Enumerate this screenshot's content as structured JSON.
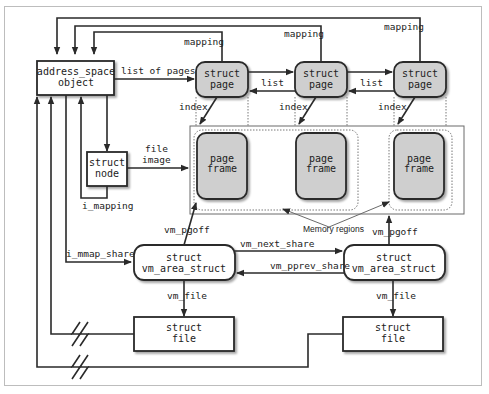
{
  "diagram": {
    "nodes": {
      "address_space": {
        "line1": "address_space",
        "line2": "object"
      },
      "page1": {
        "line1": "struct",
        "line2": "page"
      },
      "page2": {
        "line1": "struct",
        "line2": "page"
      },
      "page3": {
        "line1": "struct",
        "line2": "page"
      },
      "node": {
        "line1": "struct",
        "line2": "node"
      },
      "frame1": {
        "line1": "page",
        "line2": "frame"
      },
      "frame2": {
        "line1": "page",
        "line2": "frame"
      },
      "frame3": {
        "line1": "page",
        "line2": "frame"
      },
      "vma1": {
        "line1": "struct",
        "line2": "vm_area_struct"
      },
      "vma2": {
        "line1": "struct",
        "line2": "vm_area_struct"
      },
      "file1": {
        "line1": "struct",
        "line2": "file"
      },
      "file2": {
        "line1": "struct",
        "line2": "file"
      }
    },
    "labels": {
      "mapping1": "mapping",
      "mapping2": "mapping",
      "mapping3": "mapping",
      "list_of_pages": "list of pages",
      "list1": "list",
      "list2": "list",
      "index1": "index",
      "index2": "index",
      "index3": "index",
      "file_image_1": "file",
      "file_image_2": "image",
      "i_mapping": "i_mapping",
      "i_mmap_shared": "i_mmap_shared",
      "vm_pgoff1": "vm_pgoff",
      "vm_pgoff2": "vm_pgoff",
      "vm_next_share": "vm_next_share",
      "vm_pprev_share": "vm_pprev_share",
      "vm_file1": "vm_file",
      "vm_file2": "vm_file",
      "memory_regions": "Memory regions"
    },
    "colors": {
      "line": "#2a2a2a",
      "gray_fill": "#cfcfcf",
      "frame_border": "#bdbdbd"
    }
  }
}
